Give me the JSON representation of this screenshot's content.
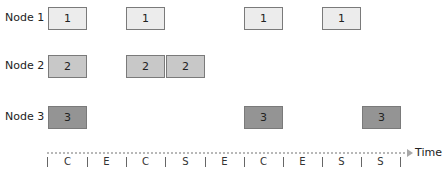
{
  "diagram": {
    "type": "timeline-schedule",
    "rows": [
      {
        "label": "Node 1",
        "boxes": [
          {
            "slot": 0,
            "text": "1"
          },
          {
            "slot": 2,
            "text": "1"
          },
          {
            "slot": 5,
            "text": "1"
          },
          {
            "slot": 7,
            "text": "1"
          }
        ]
      },
      {
        "label": "Node 2",
        "boxes": [
          {
            "slot": 0,
            "text": "2"
          },
          {
            "slot": 2,
            "text": "2"
          },
          {
            "slot": 3,
            "text": "2"
          }
        ]
      },
      {
        "label": "Node 3",
        "boxes": [
          {
            "slot": 0,
            "text": "3"
          },
          {
            "slot": 5,
            "text": "3"
          },
          {
            "slot": 8,
            "text": "3"
          }
        ]
      }
    ],
    "axis": {
      "title": "Time",
      "segments": [
        "C",
        "E",
        "C",
        "S",
        "E",
        "C",
        "E",
        "S",
        "S"
      ]
    },
    "colors": {
      "node1_fill": "#ececec",
      "node2_fill": "#c8c8c8",
      "node3_fill": "#949494",
      "box_border": "#7a7a7a",
      "axis_line": "#b8b8b8"
    }
  }
}
